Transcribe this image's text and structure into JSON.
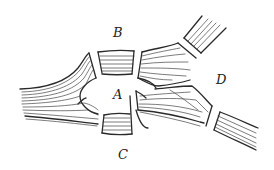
{
  "diagram": {
    "type": "river-bridges-map",
    "labels": {
      "A": "A",
      "B": "B",
      "C": "C",
      "D": "D"
    },
    "label_positions": {
      "A": [
        113,
        99
      ],
      "B": [
        113,
        37
      ],
      "C": [
        118,
        159
      ],
      "D": [
        216,
        84
      ]
    },
    "regions": [
      {
        "id": "A",
        "description": "island in center"
      },
      {
        "id": "B",
        "description": "upper bank"
      },
      {
        "id": "C",
        "description": "lower bank"
      },
      {
        "id": "D",
        "description": "eastern land between river branches"
      }
    ],
    "bridges": [
      {
        "from": "A",
        "to": "B",
        "position": "upper-left"
      },
      {
        "from": "A",
        "to": "B",
        "position": "upper-right"
      },
      {
        "from": "A",
        "to": "C",
        "position": "lower-left"
      },
      {
        "from": "A",
        "to": "C",
        "position": "lower-right"
      },
      {
        "from": "A",
        "to": "D",
        "position": "east"
      },
      {
        "from": "B",
        "to": "D",
        "position": "northeast"
      },
      {
        "from": "C",
        "to": "D",
        "position": "southeast"
      }
    ],
    "colors": {
      "ink": "#2a2a2a",
      "background": "#ffffff"
    }
  }
}
